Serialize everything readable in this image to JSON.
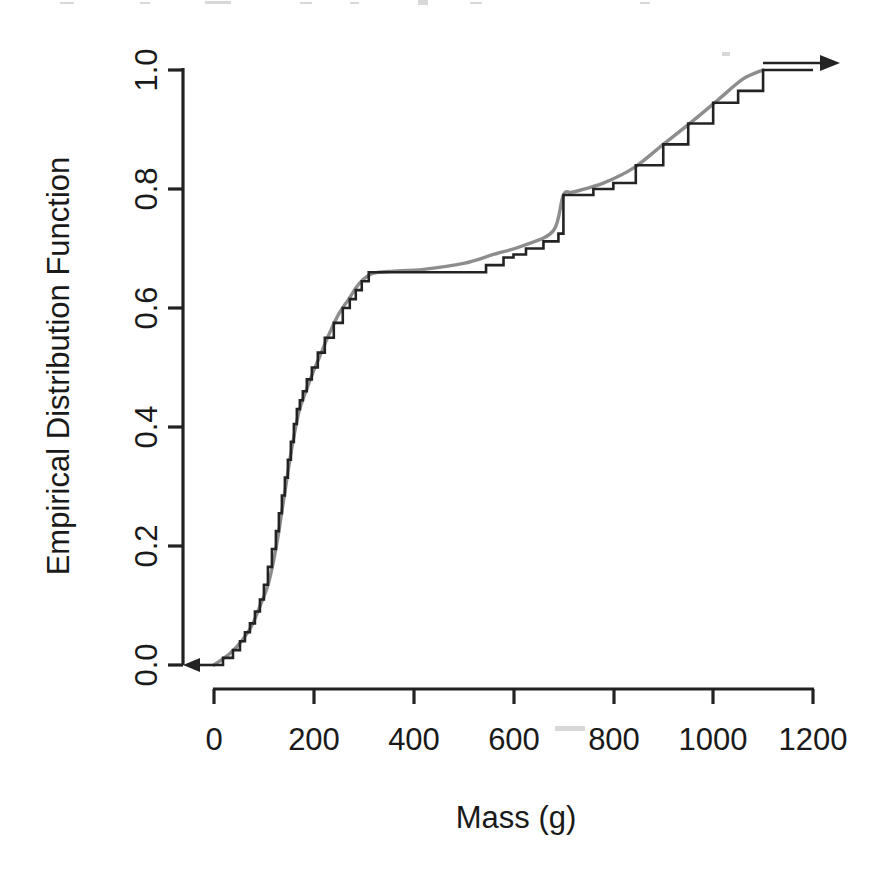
{
  "figure": {
    "background_color": "#ffffff",
    "step_color": "#232323",
    "smooth_color": "#8d8d8d"
  },
  "axes": {
    "x": {
      "label": "Mass (g)",
      "ticks": [
        {
          "value": 0,
          "label": "0"
        },
        {
          "value": 200,
          "label": "200"
        },
        {
          "value": 400,
          "label": "400"
        },
        {
          "value": 600,
          "label": "600"
        },
        {
          "value": 800,
          "label": "800"
        },
        {
          "value": 1000,
          "label": "1000"
        },
        {
          "value": 1200,
          "label": "1200"
        }
      ],
      "range": [
        0,
        1200
      ]
    },
    "y": {
      "label": "Empirical Distribution Function",
      "ticks": [
        {
          "value": 0.0,
          "label": "0.0"
        },
        {
          "value": 0.2,
          "label": "0.2"
        },
        {
          "value": 0.4,
          "label": "0.4"
        },
        {
          "value": 0.6,
          "label": "0.6"
        },
        {
          "value": 0.8,
          "label": "0.8"
        },
        {
          "value": 1.0,
          "label": "1.0"
        }
      ],
      "range": [
        0.0,
        1.0
      ]
    }
  },
  "chart_data": {
    "type": "line",
    "title": "",
    "subtitle": "",
    "xlabel": "Mass (g)",
    "ylabel": "Empirical Distribution Function",
    "xlim": [
      0,
      1200
    ],
    "ylim": [
      0.0,
      1.0
    ],
    "grid": false,
    "legend": null,
    "annotations": [
      {
        "name": "left-arrow",
        "text": "",
        "description": "leftward arrow at y = 0.0 extending to the y-axis"
      },
      {
        "name": "right-arrow",
        "text": "",
        "description": "rightward arrow at y = 1.0 extending past x = 1200"
      }
    ],
    "series": [
      {
        "name": "Empirical CDF (step function)",
        "style": "step-post",
        "color": "#232323",
        "x": [
          0,
          18,
          38,
          52,
          62,
          72,
          82,
          92,
          100,
          108,
          116,
          124,
          130,
          136,
          142,
          148,
          154,
          160,
          166,
          172,
          178,
          186,
          196,
          208,
          222,
          240,
          258,
          272,
          284,
          296,
          310,
          500,
          545,
          580,
          600,
          625,
          660,
          690,
          700,
          712,
          760,
          800,
          845,
          900,
          950,
          1000,
          1050,
          1100,
          1200
        ],
        "y": [
          0.0,
          0.012,
          0.025,
          0.04,
          0.055,
          0.07,
          0.09,
          0.11,
          0.135,
          0.165,
          0.195,
          0.225,
          0.255,
          0.285,
          0.315,
          0.345,
          0.375,
          0.405,
          0.43,
          0.445,
          0.46,
          0.48,
          0.5,
          0.525,
          0.55,
          0.575,
          0.6,
          0.615,
          0.63,
          0.645,
          0.66,
          0.66,
          0.672,
          0.685,
          0.69,
          0.7,
          0.712,
          0.725,
          0.79,
          0.79,
          0.8,
          0.81,
          0.84,
          0.875,
          0.91,
          0.945,
          0.965,
          1.0,
          1.0
        ]
      },
      {
        "name": "Smoothed / fitted distribution",
        "style": "smooth",
        "color": "#8d8d8d",
        "x": [
          0,
          30,
          55,
          75,
          95,
          110,
          125,
          140,
          155,
          170,
          185,
          200,
          215,
          230,
          250,
          270,
          290,
          310,
          330,
          360,
          420,
          500,
          560,
          620,
          680,
          700,
          720,
          780,
          840,
          900,
          960,
          1010,
          1060,
          1100
        ],
        "y": [
          0.0,
          0.018,
          0.04,
          0.065,
          0.105,
          0.14,
          0.2,
          0.28,
          0.36,
          0.425,
          0.462,
          0.495,
          0.525,
          0.555,
          0.59,
          0.615,
          0.64,
          0.655,
          0.66,
          0.662,
          0.665,
          0.675,
          0.69,
          0.705,
          0.73,
          0.79,
          0.795,
          0.81,
          0.835,
          0.875,
          0.915,
          0.95,
          0.985,
          1.0
        ]
      }
    ]
  }
}
